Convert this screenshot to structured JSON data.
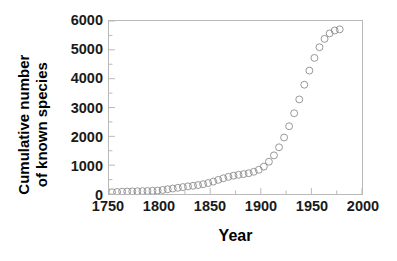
{
  "chart_data": {
    "type": "scatter",
    "title": "",
    "xlabel": "Year",
    "ylabel_lines": [
      "Cumulative number",
      "of known species"
    ],
    "ylabel": "Cumulative number of known species",
    "xlim": [
      1750,
      2000
    ],
    "ylim": [
      0,
      6000
    ],
    "xticks": [
      1750,
      1800,
      1850,
      1900,
      1950,
      2000
    ],
    "xtick_labels": [
      "1750",
      "1800",
      "1850",
      "1900",
      "1950",
      "2000"
    ],
    "yticks": [
      0,
      1000,
      2000,
      3000,
      4000,
      5000,
      6000
    ],
    "ytick_labels": [
      "0",
      "1000",
      "2000",
      "3000",
      "4000",
      "5000",
      "6000"
    ],
    "x_minor_interval": 25,
    "y_minor_interval": 500,
    "grid": false,
    "legend": null,
    "marker": {
      "shape": "open-circle",
      "diameter_px": 7,
      "fill": "none",
      "stroke": "#8c8c8c",
      "stroke_width": 0.9
    },
    "connecting_line": false,
    "series": [
      {
        "name": "Cumulative known species",
        "x": [
          1753,
          1758,
          1763,
          1768,
          1773,
          1778,
          1783,
          1788,
          1793,
          1798,
          1803,
          1808,
          1813,
          1818,
          1823,
          1828,
          1833,
          1838,
          1843,
          1848,
          1853,
          1858,
          1863,
          1868,
          1873,
          1878,
          1883,
          1888,
          1893,
          1898,
          1903,
          1908,
          1913,
          1918,
          1923,
          1928,
          1933,
          1938,
          1943,
          1948,
          1953,
          1958,
          1963,
          1968,
          1973,
          1978
        ],
        "y": [
          60,
          70,
          80,
          85,
          90,
          95,
          100,
          105,
          110,
          120,
          140,
          165,
          190,
          215,
          240,
          265,
          285,
          310,
          340,
          380,
          430,
          490,
          545,
          595,
          635,
          665,
          690,
          720,
          770,
          840,
          950,
          1120,
          1340,
          1620,
          1960,
          2350,
          2800,
          3280,
          3790,
          4280,
          4720,
          5090,
          5380,
          5570,
          5670,
          5710
        ]
      }
    ]
  },
  "axes": {
    "frame_color": "#b9b9b9",
    "tick_color": "#b9b9b9",
    "label_color": "#1a1a1a",
    "title_color": "#000000",
    "background": "#ffffff"
  }
}
